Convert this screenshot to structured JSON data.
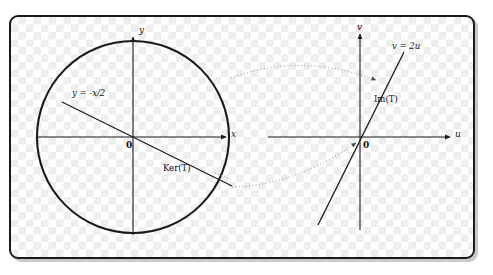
{
  "figure": {
    "title": "",
    "background": "checkerboard-transparency",
    "border_color": "#1a1a1a",
    "panel": {
      "x": 9,
      "y": 15,
      "width": 466,
      "height": 244,
      "corner_radius": 9
    }
  },
  "left_plot": {
    "name": "domain-plane-xy",
    "origin": {
      "x": 133,
      "y": 137
    },
    "axes": {
      "x_label": "x",
      "y_label": "y",
      "x_axis": {
        "x1": 38,
        "y1": 137,
        "x2": 228,
        "y2": 137,
        "arrow": true
      },
      "y_axis": {
        "x1": 133,
        "y1": 235,
        "x2": 133,
        "y2": 35,
        "arrow": true
      }
    },
    "origin_label": "0",
    "circle": {
      "cx": 133,
      "cy": 137,
      "r": 96,
      "stroke": "#1a1a1a",
      "stroke_width": 2
    },
    "kernel_line": {
      "label": "y = -x/2",
      "equation_tex": "y=-x/2",
      "slope": -0.5,
      "x1": 62,
      "y1": 102,
      "x2": 232,
      "y2": 186
    },
    "kernel_annotation": "Ker(T)"
  },
  "right_plot": {
    "name": "codomain-plane-uv",
    "origin": {
      "x": 360,
      "y": 137
    },
    "axes": {
      "x_label": "u",
      "y_label": "v",
      "u_axis": {
        "x1": 268,
        "y1": 137,
        "x2": 452,
        "y2": 137,
        "arrow": true
      },
      "v_axis": {
        "x1": 360,
        "y1": 230,
        "x2": 360,
        "y2": 32,
        "arrow": true
      }
    },
    "origin_label": "0",
    "image_line": {
      "label": "v = 2u",
      "equation_tex": "v=2u",
      "slope": 2.0,
      "x1": 318,
      "y1": 225,
      "x2": 404,
      "y2": 52
    },
    "image_annotation": "Im(T)"
  },
  "mapping_arrows": [
    {
      "name": "upper-transform-arrow",
      "style": "dotted",
      "from": {
        "x": 231,
        "y": 78
      },
      "ctrl": {
        "x": 300,
        "y": 55
      },
      "to": {
        "x": 377,
        "y": 79
      },
      "arrowhead": true
    },
    {
      "name": "lower-transform-arrow",
      "style": "dotted",
      "from": {
        "x": 232,
        "y": 186
      },
      "ctrl": {
        "x": 292,
        "y": 183
      },
      "to": {
        "x": 358,
        "y": 142
      },
      "arrowhead": true
    }
  ],
  "colors": {
    "stroke": "#1a1a1a",
    "dotted": "#8d8d8d",
    "text": "#111111",
    "checker_light": "#ffffff",
    "checker_dark": "#ededed"
  }
}
